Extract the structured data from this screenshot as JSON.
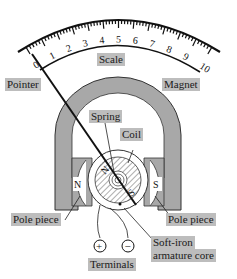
{
  "diagram": {
    "type": "moving-coil galvanometer",
    "scale": {
      "label": "Scale",
      "numbers": [
        "0",
        "1",
        "2",
        "3",
        "4",
        "5",
        "6",
        "7",
        "8",
        "9",
        "10"
      ]
    },
    "labels": {
      "pointer": "Pointer",
      "magnet": "Magnet",
      "spring": "Spring",
      "coil": "Coil",
      "pole_piece_left": "Pole piece",
      "pole_piece_right": "Pole piece",
      "core_line1": "Soft-iron",
      "core_line2": "armature core",
      "terminals": "Terminals"
    },
    "magnet_poles": {
      "left": "N",
      "right": "S",
      "core_north": "N",
      "core_south": "S"
    },
    "terminals": {
      "positive": "+",
      "negative": "−"
    },
    "colors": {
      "magnet": "#a8a8a8",
      "label_bg": "#bdbdbd",
      "line": "#111111"
    }
  }
}
